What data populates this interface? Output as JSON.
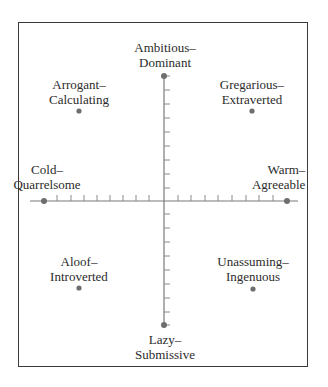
{
  "figure": {
    "type": "circumplex",
    "axis_color": "#7a7a7a",
    "dot_color": "#6e6e6e",
    "frame_color": "#3a3a3a"
  },
  "poles": {
    "top": {
      "line1": "Ambitious–",
      "line2": "Dominant"
    },
    "bottom": {
      "line1": "Lazy–",
      "line2": "Submissive"
    },
    "left": {
      "line1": "Cold–",
      "line2": "Quarrelsome"
    },
    "right": {
      "line1": "Warm–",
      "line2": "Agreeable"
    },
    "top_left": {
      "line1": "Arrogant–",
      "line2": "Calculating"
    },
    "top_right": {
      "line1": "Gregarious–",
      "line2": "Extraverted"
    },
    "bottom_left": {
      "line1": "Aloof–",
      "line2": "Introverted"
    },
    "bottom_right": {
      "line1": "Unassuming–",
      "line2": "Ingenuous"
    }
  },
  "axes": {
    "vertical_ticks": 8,
    "horizontal_ticks_each_side": 8
  }
}
